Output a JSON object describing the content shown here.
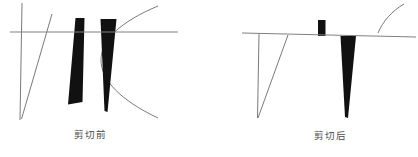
{
  "figure": {
    "type": "diagram",
    "background_color": "#ffffff",
    "stroke_color": "#5a5a5a",
    "fill_color": "#111111",
    "panels": [
      {
        "id": "before",
        "caption": "剪切前",
        "caption_x": 74,
        "caption_y": 130,
        "clip_line": {
          "x1": 10,
          "y1": 32,
          "x2": 178,
          "y2": 32
        },
        "elements": [
          {
            "name": "vertical-line",
            "kind": "line",
            "x1": 22,
            "y1": 3,
            "x2": 20,
            "y2": 120
          },
          {
            "name": "diagonal-line",
            "kind": "line",
            "x1": 52,
            "y1": 14,
            "x2": 21,
            "y2": 119
          },
          {
            "name": "left-wedge",
            "kind": "polygon",
            "points": "76,18 84,18 82,102 68,104"
          },
          {
            "name": "right-wedge",
            "kind": "polygon",
            "points": "101,19 116,19 107,111 104,110"
          },
          {
            "name": "arc-curve",
            "kind": "arc",
            "cx": 106,
            "cy": 58,
            "rx": 52,
            "ry": 54,
            "start": -68,
            "end": 68
          }
        ]
      },
      {
        "id": "after",
        "caption": "剪切后",
        "caption_x": 314,
        "caption_y": 131,
        "clip_line": {
          "x1": 242,
          "y1": 33,
          "x2": 416,
          "y2": 37
        },
        "elements": [
          {
            "name": "vertical-line-clipped",
            "kind": "line",
            "x1": 259,
            "y1": 34,
            "x2": 258,
            "y2": 118
          },
          {
            "name": "diagonal-line-clipped",
            "kind": "line",
            "x1": 288,
            "y1": 35,
            "x2": 258,
            "y2": 118
          },
          {
            "name": "small-bar",
            "kind": "polygon",
            "points": "318,20 325,20 325,35 318,35"
          },
          {
            "name": "clipped-wedge",
            "kind": "polygon",
            "points": "341,36 356,36 348,118 345,117"
          },
          {
            "name": "arc-fragment",
            "kind": "arc",
            "cx": 352,
            "cy": 42,
            "rx": 52,
            "ry": 54,
            "start": -70,
            "end": -10
          }
        ]
      }
    ],
    "labels": {
      "before": "剪切前",
      "after": "剪切后"
    }
  }
}
